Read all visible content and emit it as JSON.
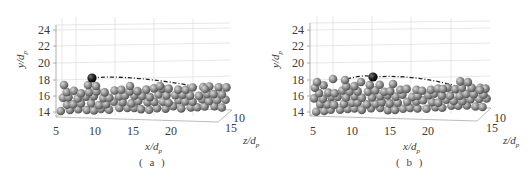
{
  "chart_data": [
    {
      "type": "scatter",
      "subtype": "3d-particle-bed",
      "caption": "(a)",
      "xlabel": "x/d_p",
      "ylabel": "y/d_p",
      "zlabel": "z/d_p",
      "x_ticks": [
        "5",
        "10",
        "15",
        "20"
      ],
      "y_ticks": [
        "14",
        "16",
        "18",
        "20",
        "22",
        "24"
      ],
      "z_ticks": [
        "10",
        "15"
      ],
      "ylim": [
        14,
        24.5
      ],
      "xlim": [
        5,
        25
      ],
      "grid": true,
      "bed_particles": {
        "color": "#8a8a8a",
        "y_range": [
          14,
          17.3
        ]
      },
      "highlighted_particle": {
        "x": 9.5,
        "y": 18.3,
        "color": "#1a1a1a"
      },
      "trajectory": {
        "style": "dash-dot",
        "x": [
          9.5,
          13,
          17,
          21,
          24
        ],
        "y": [
          18.3,
          18.2,
          17.9,
          17.5,
          17.2
        ]
      }
    },
    {
      "type": "scatter",
      "subtype": "3d-particle-bed",
      "caption": "(b)",
      "xlabel": "x/d_p",
      "ylabel": "y/d_p",
      "zlabel": "z/d_p",
      "x_ticks": [
        "5",
        "10",
        "15",
        "20"
      ],
      "y_ticks": [
        "14",
        "16",
        "18",
        "20",
        "22",
        "24"
      ],
      "z_ticks": [
        "10",
        "15"
      ],
      "ylim": [
        14,
        24.5
      ],
      "xlim": [
        5,
        25
      ],
      "grid": true,
      "bed_particles": {
        "color": "#8a8a8a",
        "y_range": [
          14,
          17.8
        ]
      },
      "highlighted_particle": {
        "x": 13,
        "y": 18.4,
        "color": "#1a1a1a"
      },
      "trajectory": {
        "style": "dash-dot",
        "x": [
          9,
          13,
          17,
          21,
          24
        ],
        "y": [
          18.2,
          18.4,
          18.0,
          17.4,
          17.0
        ]
      }
    }
  ],
  "panels": [
    {
      "caption": "( a )",
      "xlabel": "x/d",
      "xlabel_sub": "p",
      "ylabel": "y/d",
      "ylabel_sub": "p",
      "zlabel": "z/d",
      "zlabel_sub": "p",
      "y_ticks": [
        "24",
        "22",
        "20",
        "18",
        "16",
        "14"
      ],
      "x_ticks": [
        "5",
        "10",
        "15",
        "20"
      ],
      "z_ticks": [
        "10",
        "15"
      ]
    },
    {
      "caption": "( b )",
      "xlabel": "x/d",
      "xlabel_sub": "p",
      "ylabel": "y/d",
      "ylabel_sub": "p",
      "zlabel": "z/d",
      "zlabel_sub": "p",
      "y_ticks": [
        "24",
        "22",
        "20",
        "18",
        "16",
        "14"
      ],
      "x_ticks": [
        "5",
        "10",
        "15",
        "20"
      ],
      "z_ticks": [
        "10",
        "15"
      ]
    }
  ]
}
